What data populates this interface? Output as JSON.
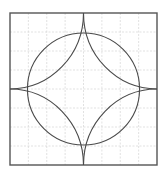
{
  "diagram": {
    "title": "",
    "grid": {
      "divisions": 8,
      "style": "dashed"
    },
    "square": {
      "side_units": 8
    },
    "circle": {
      "radius_units": 3
    },
    "corner_arcs": {
      "count": 4,
      "radius_units": 4,
      "centers": [
        "top-left",
        "top-right",
        "bottom-right",
        "bottom-left"
      ]
    },
    "colors": {
      "line": "#4a4a4a",
      "frame": "#555555",
      "grid": "#d9d9d9",
      "background": "#ffffff"
    }
  }
}
